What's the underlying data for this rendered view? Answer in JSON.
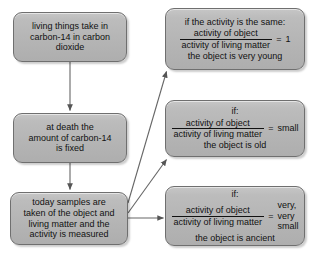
{
  "diagram": {
    "background_color": "#ffffff",
    "box_fill_color": "#b8b8b8",
    "box_border_color": "#6f6f6f",
    "text_color": "#111111",
    "arrow_color": "#555555"
  },
  "boxes": {
    "intake": {
      "lines": [
        "living things take in",
        "carbon-14 in carbon",
        "dioxide"
      ]
    },
    "death": {
      "lines": [
        "at death the",
        "amount of carbon-14",
        "is fixed"
      ]
    },
    "sampling": {
      "lines": [
        "today samples are",
        "taken of the object and",
        "living matter and the",
        "activity is measured"
      ]
    },
    "young": {
      "caption_top": "if the activity is the same:",
      "numerator": "activity of object",
      "denominator": "activity of living matter",
      "equals": "=",
      "result": "1",
      "caption_bottom": "the object is very young"
    },
    "old": {
      "caption_top": "if:",
      "numerator": "activity of object",
      "denominator": "activity of living matter",
      "equals": "=",
      "result": "small",
      "caption_bottom": "the object is old"
    },
    "ancient": {
      "caption_top": "if:",
      "numerator": "activity of object",
      "denominator": "activity of living matter",
      "equals": "=",
      "result_lines": [
        "very,",
        "very",
        "small"
      ],
      "caption_bottom": "the object is ancient"
    }
  },
  "connectors": [
    {
      "name": "intake-to-death",
      "kind": "vertical-arrow",
      "from": "intake",
      "to": "death"
    },
    {
      "name": "death-to-sampling",
      "kind": "vertical-arrow",
      "from": "death",
      "to": "sampling"
    },
    {
      "name": "sampling-to-young",
      "kind": "diagonal-arrow",
      "from": "sampling",
      "to": "young"
    },
    {
      "name": "sampling-to-old",
      "kind": "diagonal-arrow",
      "from": "sampling",
      "to": "old"
    },
    {
      "name": "sampling-to-ancient",
      "kind": "horizontal-arrow",
      "from": "sampling",
      "to": "ancient"
    }
  ]
}
